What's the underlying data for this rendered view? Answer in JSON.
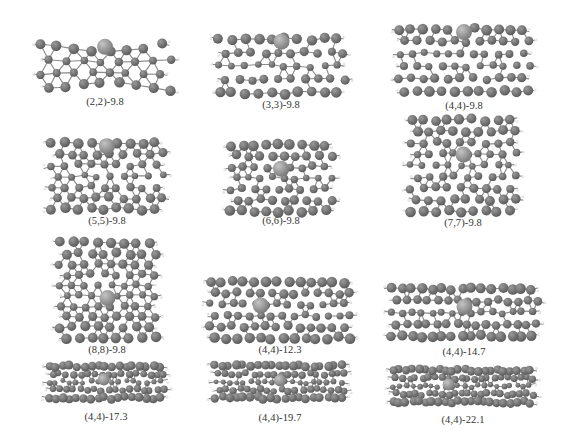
{
  "figure": {
    "panels": [
      {
        "id": "p1",
        "label": "(2,2)-9.8",
        "chirality": "(2,2)",
        "length": "9.8",
        "cx": 105,
        "top": 38,
        "w": 150,
        "h": 58,
        "label_y": 102,
        "shape": "pinched",
        "rings": 4,
        "cols": 8,
        "big": {
          "x": 0.5,
          "y": 0.08
        }
      },
      {
        "id": "p2",
        "label": "(3,3)-9.8",
        "chirality": "(3,3)",
        "length": "9.8",
        "cx": 281,
        "top": 34,
        "w": 145,
        "h": 64,
        "label_y": 105,
        "shape": "tube",
        "rings": 5,
        "cols": 10,
        "big": {
          "x": 0.5,
          "y": 0.05
        }
      },
      {
        "id": "p3",
        "label": "(4,4)-9.8",
        "chirality": "(4,4)",
        "length": "9.8",
        "cx": 464,
        "top": 24,
        "w": 150,
        "h": 72,
        "label_y": 106,
        "shape": "tube",
        "rings": 6,
        "cols": 11,
        "big": {
          "x": 0.5,
          "y": 0.05
        }
      },
      {
        "id": "p4",
        "label": "(5,5)-9.8",
        "chirality": "(5,5)",
        "length": "9.8",
        "cx": 107,
        "top": 138,
        "w": 130,
        "h": 76,
        "label_y": 221,
        "shape": "tube",
        "rings": 7,
        "cols": 9,
        "big": {
          "x": 0.5,
          "y": 0.05
        }
      },
      {
        "id": "p5",
        "label": "(6,6)-9.8",
        "chirality": "(6,6)",
        "length": "9.8",
        "cx": 281,
        "top": 140,
        "w": 120,
        "h": 76,
        "label_y": 221,
        "shape": "tube",
        "rings": 7,
        "cols": 9,
        "big": {
          "x": 0.5,
          "y": 0.36
        }
      },
      {
        "id": "p6",
        "label": "(7,7)-9.8",
        "chirality": "(7,7)",
        "length": "9.8",
        "cx": 463,
        "top": 115,
        "w": 125,
        "h": 101,
        "label_y": 223,
        "shape": "tube",
        "rings": 9,
        "cols": 9,
        "big": {
          "x": 0.5,
          "y": 0.38
        }
      },
      {
        "id": "p7",
        "label": "(8,8)-9.8",
        "chirality": "(8,8)",
        "length": "9.8",
        "cx": 107,
        "top": 238,
        "w": 115,
        "h": 105,
        "label_y": 350,
        "shape": "tube",
        "rings": 10,
        "cols": 8,
        "big": {
          "x": 0.5,
          "y": 0.58
        }
      },
      {
        "id": "p8",
        "label": "(4,4)-12.3",
        "chirality": "(4,4)",
        "length": "12.3",
        "cx": 280,
        "top": 277,
        "w": 160,
        "h": 66,
        "label_y": 350,
        "shape": "tube",
        "rings": 6,
        "cols": 13,
        "big": {
          "x": 0.38,
          "y": 0.42
        }
      },
      {
        "id": "p9",
        "label": "(4,4)-14.7",
        "chirality": "(4,4)",
        "length": "14.7",
        "cx": 464,
        "top": 284,
        "w": 165,
        "h": 57,
        "label_y": 352,
        "shape": "tube",
        "rings": 5,
        "cols": 15,
        "big": {
          "x": 0.5,
          "y": 0.38
        }
      },
      {
        "id": "p10",
        "label": "(4,4)-17.3",
        "chirality": "(4,4)",
        "length": "17.3",
        "cx": 106,
        "top": 361,
        "w": 135,
        "h": 42,
        "label_y": 417,
        "shape": "tube",
        "rings": 5,
        "cols": 17,
        "big": {
          "x": 0.48,
          "y": 0.42
        }
      },
      {
        "id": "p11",
        "label": "(4,4)-19.7",
        "chirality": "(4,4)",
        "length": "19.7",
        "cx": 280,
        "top": 361,
        "w": 150,
        "h": 42,
        "label_y": 418,
        "shape": "tube",
        "rings": 5,
        "cols": 19,
        "big": {
          "x": 0.5,
          "y": 0.45
        }
      },
      {
        "id": "p12",
        "label": "(4,4)-22.1",
        "chirality": "(4,4)",
        "length": "22.1",
        "cx": 463,
        "top": 365,
        "w": 160,
        "h": 42,
        "label_y": 420,
        "shape": "tube",
        "rings": 5,
        "cols": 22,
        "big": {
          "x": 0.41,
          "y": 0.45
        }
      }
    ],
    "colors": {
      "background": "#ffffff",
      "carbon": "#5a5a5a",
      "carbon_highlight": "#9a9a9a",
      "dopant": "#7a7a7a",
      "dopant_highlight": "#c4c4c4",
      "hydrogen": "#d8d8d8",
      "bond": "#8a8a8a",
      "label": "#333333"
    }
  }
}
